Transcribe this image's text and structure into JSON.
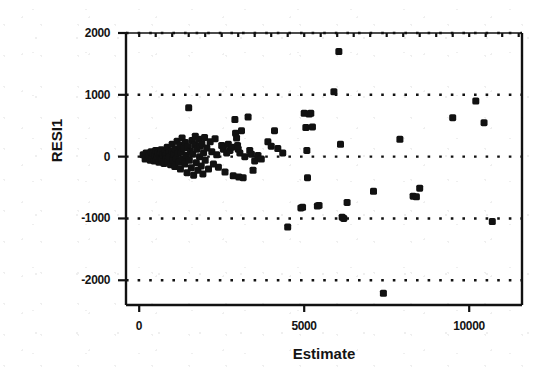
{
  "chart_data": {
    "type": "scatter",
    "title": "",
    "xlabel": "Estimate",
    "ylabel": "RESI1",
    "xlim": [
      -400,
      11600
    ],
    "ylim": [
      -2400,
      2000
    ],
    "xticks": [
      0,
      5000,
      10000
    ],
    "xtick_labels": [
      "0",
      "5000",
      "10000"
    ],
    "yticks": [
      2000,
      1000,
      0,
      -1000,
      -2000
    ],
    "ytick_labels": [
      "2000",
      "1000",
      "0",
      "-1000",
      "-2000"
    ],
    "gridlines": {
      "horizontal": [
        2000,
        1000,
        0,
        -1000,
        -2000
      ],
      "style": "dotted",
      "vertical": []
    },
    "legend": null,
    "marker": {
      "shape": "square",
      "color": "#111111",
      "size": 7
    },
    "points": [
      [
        120,
        30
      ],
      [
        180,
        -40
      ],
      [
        210,
        60
      ],
      [
        260,
        -20
      ],
      [
        300,
        10
      ],
      [
        340,
        -60
      ],
      [
        360,
        80
      ],
      [
        390,
        -30
      ],
      [
        420,
        50
      ],
      [
        450,
        -70
      ],
      [
        470,
        20
      ],
      [
        500,
        100
      ],
      [
        520,
        -50
      ],
      [
        550,
        0
      ],
      [
        580,
        60
      ],
      [
        600,
        -90
      ],
      [
        620,
        40
      ],
      [
        650,
        -20
      ],
      [
        670,
        110
      ],
      [
        700,
        -60
      ],
      [
        720,
        30
      ],
      [
        750,
        -110
      ],
      [
        770,
        70
      ],
      [
        800,
        20
      ],
      [
        820,
        -40
      ],
      [
        850,
        150
      ],
      [
        870,
        -80
      ],
      [
        900,
        60
      ],
      [
        920,
        0
      ],
      [
        950,
        -130
      ],
      [
        980,
        90
      ],
      [
        1000,
        200
      ],
      [
        1020,
        -50
      ],
      [
        1050,
        40
      ],
      [
        1080,
        -160
      ],
      [
        1100,
        120
      ],
      [
        1130,
        -30
      ],
      [
        1150,
        250
      ],
      [
        1180,
        60
      ],
      [
        1200,
        -90
      ],
      [
        1230,
        180
      ],
      [
        1250,
        -200
      ],
      [
        1280,
        70
      ],
      [
        1300,
        300
      ],
      [
        1330,
        -40
      ],
      [
        1350,
        140
      ],
      [
        1380,
        -120
      ],
      [
        1400,
        230
      ],
      [
        1430,
        20
      ],
      [
        1450,
        -260
      ],
      [
        1480,
        160
      ],
      [
        1500,
        790
      ],
      [
        1520,
        -60
      ],
      [
        1550,
        90
      ],
      [
        1580,
        -180
      ],
      [
        1600,
        260
      ],
      [
        1620,
        40
      ],
      [
        1650,
        -300
      ],
      [
        1680,
        190
      ],
      [
        1700,
        330
      ],
      [
        1730,
        -100
      ],
      [
        1750,
        120
      ],
      [
        1780,
        -220
      ],
      [
        1800,
        280
      ],
      [
        1830,
        0
      ],
      [
        1850,
        170
      ],
      [
        1880,
        -150
      ],
      [
        1900,
        210
      ],
      [
        1930,
        -280
      ],
      [
        1950,
        60
      ],
      [
        1980,
        310
      ],
      [
        2000,
        -60
      ],
      [
        2050,
        140
      ],
      [
        2100,
        -200
      ],
      [
        2150,
        240
      ],
      [
        2200,
        80
      ],
      [
        2250,
        -120
      ],
      [
        2300,
        290
      ],
      [
        2350,
        30
      ],
      [
        2400,
        -170
      ],
      [
        2500,
        180
      ],
      [
        2550,
        120
      ],
      [
        2600,
        -250
      ],
      [
        2650,
        60
      ],
      [
        2700,
        200
      ],
      [
        2750,
        100
      ],
      [
        2800,
        150
      ],
      [
        2850,
        -310
      ],
      [
        2900,
        600
      ],
      [
        2920,
        380
      ],
      [
        2950,
        300
      ],
      [
        2980,
        180
      ],
      [
        3000,
        120
      ],
      [
        3020,
        -330
      ],
      [
        3050,
        60
      ],
      [
        3100,
        420
      ],
      [
        3150,
        -340
      ],
      [
        3200,
        0
      ],
      [
        3300,
        640
      ],
      [
        3350,
        100
      ],
      [
        3400,
        40
      ],
      [
        3450,
        -220
      ],
      [
        3500,
        -70
      ],
      [
        3600,
        20
      ],
      [
        3700,
        -40
      ],
      [
        3900,
        240
      ],
      [
        4000,
        170
      ],
      [
        4100,
        420
      ],
      [
        4200,
        130
      ],
      [
        4350,
        60
      ],
      [
        4500,
        -1140
      ],
      [
        4900,
        -830
      ],
      [
        4950,
        -820
      ],
      [
        5000,
        700
      ],
      [
        5050,
        470
      ],
      [
        5080,
        100
      ],
      [
        5100,
        -340
      ],
      [
        5150,
        690
      ],
      [
        5200,
        700
      ],
      [
        5250,
        480
      ],
      [
        5400,
        -800
      ],
      [
        5450,
        -790
      ],
      [
        5900,
        1050
      ],
      [
        6050,
        1700
      ],
      [
        6100,
        200
      ],
      [
        6150,
        -980
      ],
      [
        6200,
        -1000
      ],
      [
        6300,
        -740
      ],
      [
        7100,
        -560
      ],
      [
        7400,
        -2210
      ],
      [
        7900,
        280
      ],
      [
        8300,
        -640
      ],
      [
        8400,
        -650
      ],
      [
        8500,
        -510
      ],
      [
        9500,
        630
      ],
      [
        10200,
        900
      ],
      [
        10450,
        550
      ],
      [
        10700,
        -1050
      ]
    ]
  },
  "axes": {
    "frame": {
      "left": 126,
      "right": 522,
      "top": 33,
      "bottom": 305
    },
    "tick_marks_top": true,
    "tick_marks_bottom": true
  }
}
